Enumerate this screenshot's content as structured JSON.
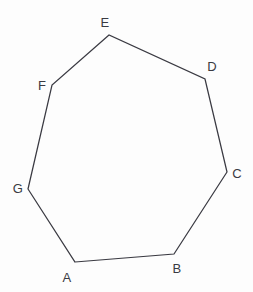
{
  "figure": {
    "name": "heptagon-abcdefg",
    "type": "polygon-diagram",
    "canvas": {
      "width": 253,
      "height": 292
    },
    "background_color": "#fdfdfd",
    "stroke_color": "#3a3a42",
    "stroke_width": 1.25,
    "label_color": "#3a3a42",
    "label_font_size": 13,
    "sides": 7,
    "closed": true,
    "vertex_order": [
      "A",
      "B",
      "C",
      "D",
      "E",
      "F",
      "G"
    ],
    "points_path": "75,262 174,254 227,172 205,79 109,35 52,85 28,189",
    "vertices": [
      {
        "label": "A",
        "x": 75,
        "y": 262,
        "label_x": 67,
        "label_y": 277
      },
      {
        "label": "B",
        "x": 174,
        "y": 254,
        "label_x": 177,
        "label_y": 268
      },
      {
        "label": "C",
        "x": 227,
        "y": 172,
        "label_x": 237,
        "label_y": 173
      },
      {
        "label": "D",
        "x": 205,
        "y": 79,
        "label_x": 212,
        "label_y": 66
      },
      {
        "label": "E",
        "x": 109,
        "y": 35,
        "label_x": 105,
        "label_y": 22
      },
      {
        "label": "F",
        "x": 52,
        "y": 85,
        "label_x": 42,
        "label_y": 85
      },
      {
        "label": "G",
        "x": 28,
        "y": 189,
        "label_x": 18,
        "label_y": 188
      }
    ],
    "edges": [
      {
        "name": "edge-AB",
        "from": "A",
        "to": "B"
      },
      {
        "name": "edge-BC",
        "from": "B",
        "to": "C"
      },
      {
        "name": "edge-CD",
        "from": "C",
        "to": "D"
      },
      {
        "name": "edge-DE",
        "from": "D",
        "to": "E"
      },
      {
        "name": "edge-EF",
        "from": "E",
        "to": "F"
      },
      {
        "name": "edge-FG",
        "from": "F",
        "to": "G"
      },
      {
        "name": "edge-GA",
        "from": "G",
        "to": "A"
      }
    ]
  }
}
